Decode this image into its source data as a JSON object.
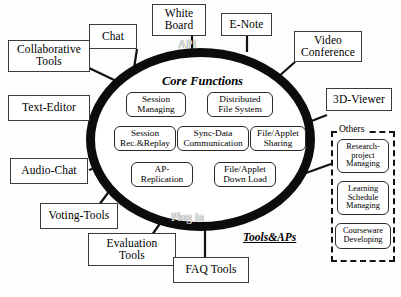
{
  "diagram": {
    "center": {
      "band_top_label": "API",
      "band_bottom_label": "Plug in",
      "core_title": "Core Functions",
      "functions": [
        {
          "name": "session-managing",
          "label": "Session\nManaging"
        },
        {
          "name": "distributed-file-system",
          "label": "Distributed\nFile System"
        },
        {
          "name": "session-rec-replay",
          "label": "Session\nRec.&Replay"
        },
        {
          "name": "sync-data-communication",
          "label": "Sync-Data\nCommunication"
        },
        {
          "name": "file-applet-sharing",
          "label": "File/Applet\nSharing"
        },
        {
          "name": "ap-replication",
          "label": "AP-\nReplication"
        },
        {
          "name": "file-applet-download",
          "label": "File/Applet\nDown Load"
        }
      ]
    },
    "tools_label": "Tools&APs",
    "outer_nodes": [
      {
        "name": "collaborative-tools",
        "label": "Collaborative\nTools"
      },
      {
        "name": "chat",
        "label": "Chat"
      },
      {
        "name": "white-board",
        "label": "White\nBoard"
      },
      {
        "name": "e-note",
        "label": "E-Note"
      },
      {
        "name": "video-conference",
        "label": "Video\nConference"
      },
      {
        "name": "3d-viewer",
        "label": "3D-Viewer"
      },
      {
        "name": "text-editor",
        "label": "Text-Editor"
      },
      {
        "name": "audio-chat",
        "label": "Audio-Chat"
      },
      {
        "name": "voting-tools",
        "label": "Voting-Tools"
      },
      {
        "name": "evaluation-tools",
        "label": "Evaluation\nTools"
      },
      {
        "name": "faq-tools",
        "label": "FAQ Tools"
      }
    ],
    "others": {
      "title": "Others",
      "items": [
        {
          "name": "research-project-managing",
          "label": "Research-\nproject\nManaging"
        },
        {
          "name": "learning-schedule-managing",
          "label": "Learning\nSchedule\nManaging"
        },
        {
          "name": "courseware-developing",
          "label": "Courseware\nDeveloping"
        }
      ]
    },
    "colors": {
      "ring": "#0c0c0c",
      "box_border": "#3b3b3b",
      "background": "#fdfdfb"
    }
  }
}
